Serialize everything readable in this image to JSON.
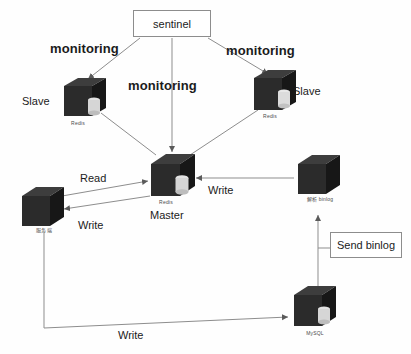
{
  "diagram": {
    "colors": {
      "server_body": "#2b2b2b",
      "server_top": "#3d3d3d",
      "server_side": "#171717",
      "disk": "#d6d6d6",
      "line": "#8d8d8d",
      "text": "#1b1b1b",
      "background": "#fefefe"
    },
    "boxes": [
      {
        "id": "sentinel",
        "label": "sentinel"
      },
      {
        "id": "send-binlog",
        "label": "Send binlog"
      }
    ],
    "servers": [
      {
        "id": "slave-left",
        "role_label": "Slave",
        "caption": "Redis"
      },
      {
        "id": "slave-right",
        "role_label": "Slave",
        "caption": "Redis"
      },
      {
        "id": "master",
        "role_label": "Master",
        "caption": "Redis"
      },
      {
        "id": "app-server",
        "role_label": "",
        "caption": "服务端"
      },
      {
        "id": "binlog-parser",
        "role_label": "",
        "caption": "解析 binlog"
      },
      {
        "id": "mysql",
        "role_label": "",
        "caption": "MySQL"
      }
    ],
    "edge_labels": [
      {
        "id": "monitoring-left",
        "text": "monitoring"
      },
      {
        "id": "monitoring-center",
        "text": "monitoring"
      },
      {
        "id": "monitoring-right",
        "text": "monitoring"
      },
      {
        "id": "read",
        "text": "Read"
      },
      {
        "id": "write-master",
        "text": "Write"
      },
      {
        "id": "write-app",
        "text": "Write"
      },
      {
        "id": "write-bottom",
        "text": "Write"
      }
    ]
  }
}
